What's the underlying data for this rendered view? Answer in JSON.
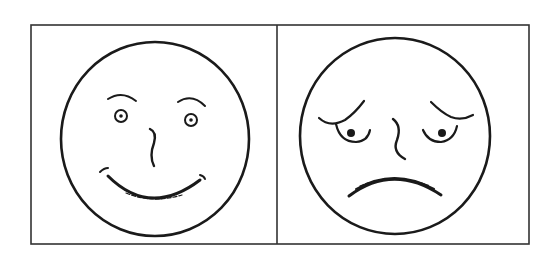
{
  "figure": {
    "panels": [
      {
        "id": "left",
        "expression": "happy",
        "icon": "smiling-face-icon"
      },
      {
        "id": "right",
        "expression": "sad",
        "icon": "worried-face-icon"
      }
    ],
    "colors": {
      "background": "#ffffff",
      "stroke": "#1a1a1a",
      "frame": "#333333"
    }
  }
}
